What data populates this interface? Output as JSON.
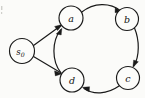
{
  "figure": {
    "type": "directed-graph",
    "title": "",
    "background_color": "#fbfbf9",
    "stroke_color": "#1a1a1a",
    "node_fill_color": "#fcfcfa"
  },
  "nodes": [
    {
      "id": "s0",
      "label": "s",
      "subscript": "0",
      "cx": 22,
      "cy": 51,
      "r": 12.5
    },
    {
      "id": "a",
      "label": "a",
      "subscript": "",
      "cx": 71,
      "cy": 18,
      "r": 12.0
    },
    {
      "id": "b",
      "label": "b",
      "subscript": "",
      "cx": 127,
      "cy": 19,
      "r": 11.5
    },
    {
      "id": "c",
      "label": "c",
      "subscript": "",
      "cx": 128,
      "cy": 78,
      "r": 11.5
    },
    {
      "id": "d",
      "label": "d",
      "subscript": "",
      "cx": 72,
      "cy": 80,
      "r": 12.0
    }
  ],
  "edges": [
    {
      "id": "s0-a",
      "from": "s0",
      "to": "a",
      "style": "straight",
      "directed": true
    },
    {
      "id": "s0-d",
      "from": "s0",
      "to": "d",
      "style": "straight",
      "directed": true
    },
    {
      "id": "a-b",
      "from": "a",
      "to": "b",
      "style": "arc-outer-top",
      "directed": true
    },
    {
      "id": "b-c",
      "from": "b",
      "to": "c",
      "style": "arc-outer-right",
      "directed": true
    },
    {
      "id": "c-d",
      "from": "c",
      "to": "d",
      "style": "arc-outer-bottom",
      "directed": true
    },
    {
      "id": "d-a",
      "from": "d",
      "to": "a",
      "style": "arc-outer-left",
      "directed": true
    }
  ]
}
